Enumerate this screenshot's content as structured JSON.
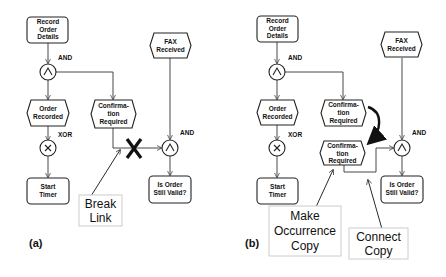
{
  "panels": [
    {
      "tag": "(a)",
      "nodes": {
        "record_order": [
          "Record",
          "Order",
          "Details"
        ],
        "fax_received": [
          "FAX",
          "Received"
        ],
        "order_recorded": [
          "Order",
          "Recorded"
        ],
        "confirmation_required": [
          "Confirma-",
          "tion",
          "Required"
        ],
        "start_timer": [
          "Start",
          "Timer"
        ],
        "is_order_valid": [
          "Is Order",
          "Still Valid?"
        ]
      },
      "gates": {
        "and_top": {
          "label": "AND",
          "symbol": "^"
        },
        "xor": {
          "label": "XOR",
          "symbol": "×"
        },
        "and_right": {
          "label": "AND",
          "symbol": "^"
        }
      },
      "callouts": {
        "break_link": [
          "Break",
          "Link"
        ]
      }
    },
    {
      "tag": "(b)",
      "nodes": {
        "record_order": [
          "Record",
          "Order",
          "Details"
        ],
        "fax_received": [
          "FAX",
          "Received"
        ],
        "order_recorded": [
          "Order",
          "Recorded"
        ],
        "confirmation_required": [
          "Confirma-",
          "tion",
          "Required"
        ],
        "confirmation_copy": [
          "Confirma-",
          "tion",
          "Required"
        ],
        "start_timer": [
          "Start",
          "Timer"
        ],
        "is_order_valid": [
          "Is Order",
          "Still Valid?"
        ]
      },
      "gates": {
        "and_top": {
          "label": "AND",
          "symbol": "^"
        },
        "xor": {
          "label": "XOR",
          "symbol": "×"
        },
        "and_right": {
          "label": "AND",
          "symbol": "^"
        }
      },
      "callouts": {
        "make_copy": [
          "Make",
          "Occurrence",
          "Copy"
        ],
        "connect_copy": [
          "Connect",
          "Copy"
        ]
      }
    }
  ],
  "colors": {
    "stroke": "#222222",
    "background": "#ffffff",
    "callout_border": "#cccccc"
  }
}
